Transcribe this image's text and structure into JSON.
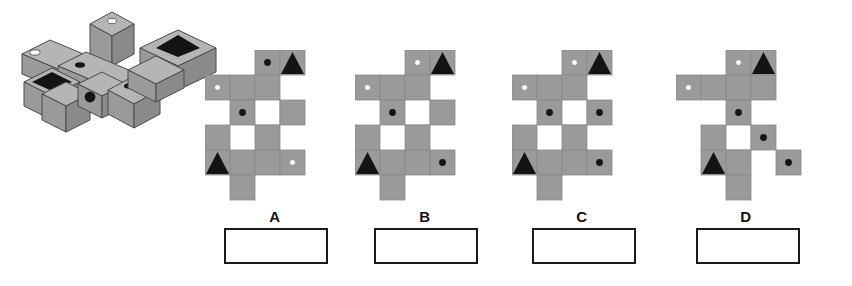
{
  "page": {
    "background_color": "#ffffff"
  },
  "palette": {
    "face_gray": "#9a9a9a",
    "face_gray_light": "#b5b5b5",
    "face_gray_dark": "#8a8a8a",
    "marking_black": "#141414",
    "marking_white": "#ffffff",
    "outline": "#4a4a4a",
    "box_border": "#1a1a1a",
    "label_text": "#111111"
  },
  "stimulus": {
    "name": "isometric-cube-assembly",
    "description": "Three-dimensional assembly of cubes drawn in isometric projection with marked faces",
    "markings": [
      {
        "type": "white-dot",
        "location": "top face of tall raised cube at back"
      },
      {
        "type": "white-dot",
        "location": "top face of left-front long block"
      },
      {
        "type": "black-dot",
        "location": "top face of center-left cube"
      },
      {
        "type": "black-dot",
        "location": "front face of center cube"
      },
      {
        "type": "black-dot",
        "location": "top face of right-front cube"
      },
      {
        "type": "black-triangle",
        "location": "top face of right-rear block"
      },
      {
        "type": "black-triangle",
        "location": "top face of left cube"
      }
    ]
  },
  "grid": {
    "cell_size": 25,
    "columns": 5,
    "rows": 6
  },
  "options": [
    {
      "id": "A",
      "label": "A",
      "name": "option-a",
      "left": 205,
      "cells": [
        {
          "col": 2,
          "row": 0,
          "fill": "gray",
          "mark": "black-dot"
        },
        {
          "col": 3,
          "row": 0,
          "fill": "gray",
          "mark": "black-triangle"
        },
        {
          "col": 0,
          "row": 1,
          "fill": "gray",
          "mark": "white-dot"
        },
        {
          "col": 1,
          "row": 1,
          "fill": "gray",
          "mark": "none"
        },
        {
          "col": 2,
          "row": 1,
          "fill": "gray",
          "mark": "none"
        },
        {
          "col": 1,
          "row": 2,
          "fill": "gray",
          "mark": "black-dot"
        },
        {
          "col": 2,
          "row": 2,
          "fill": "white",
          "mark": "none"
        },
        {
          "col": 3,
          "row": 2,
          "fill": "gray",
          "mark": "none"
        },
        {
          "col": 0,
          "row": 3,
          "fill": "gray",
          "mark": "none"
        },
        {
          "col": 2,
          "row": 3,
          "fill": "gray",
          "mark": "none"
        },
        {
          "col": 0,
          "row": 4,
          "fill": "gray",
          "mark": "black-triangle"
        },
        {
          "col": 1,
          "row": 4,
          "fill": "gray",
          "mark": "none"
        },
        {
          "col": 2,
          "row": 4,
          "fill": "gray",
          "mark": "none"
        },
        {
          "col": 3,
          "row": 4,
          "fill": "gray",
          "mark": "white-dot"
        },
        {
          "col": 1,
          "row": 5,
          "fill": "gray",
          "mark": "none"
        }
      ]
    },
    {
      "id": "B",
      "label": "B",
      "name": "option-b",
      "left": 355,
      "cells": [
        {
          "col": 2,
          "row": 0,
          "fill": "gray",
          "mark": "white-dot"
        },
        {
          "col": 3,
          "row": 0,
          "fill": "gray",
          "mark": "black-triangle"
        },
        {
          "col": 0,
          "row": 1,
          "fill": "gray",
          "mark": "white-dot"
        },
        {
          "col": 1,
          "row": 1,
          "fill": "gray",
          "mark": "none"
        },
        {
          "col": 2,
          "row": 1,
          "fill": "gray",
          "mark": "none"
        },
        {
          "col": 1,
          "row": 2,
          "fill": "gray",
          "mark": "black-dot"
        },
        {
          "col": 2,
          "row": 2,
          "fill": "white",
          "mark": "none"
        },
        {
          "col": 3,
          "row": 2,
          "fill": "gray",
          "mark": "none"
        },
        {
          "col": 0,
          "row": 3,
          "fill": "gray",
          "mark": "none"
        },
        {
          "col": 2,
          "row": 3,
          "fill": "gray",
          "mark": "none"
        },
        {
          "col": 0,
          "row": 4,
          "fill": "gray",
          "mark": "black-triangle"
        },
        {
          "col": 1,
          "row": 4,
          "fill": "gray",
          "mark": "none"
        },
        {
          "col": 2,
          "row": 4,
          "fill": "gray",
          "mark": "none"
        },
        {
          "col": 3,
          "row": 4,
          "fill": "gray",
          "mark": "black-dot"
        },
        {
          "col": 1,
          "row": 5,
          "fill": "gray",
          "mark": "none"
        }
      ]
    },
    {
      "id": "C",
      "label": "C",
      "name": "option-c",
      "left": 512,
      "cells": [
        {
          "col": 2,
          "row": 0,
          "fill": "gray",
          "mark": "white-dot"
        },
        {
          "col": 3,
          "row": 0,
          "fill": "gray",
          "mark": "black-triangle"
        },
        {
          "col": 0,
          "row": 1,
          "fill": "gray",
          "mark": "white-dot"
        },
        {
          "col": 1,
          "row": 1,
          "fill": "gray",
          "mark": "none"
        },
        {
          "col": 2,
          "row": 1,
          "fill": "gray",
          "mark": "none"
        },
        {
          "col": 1,
          "row": 2,
          "fill": "gray",
          "mark": "black-dot"
        },
        {
          "col": 2,
          "row": 2,
          "fill": "white",
          "mark": "none"
        },
        {
          "col": 3,
          "row": 2,
          "fill": "gray",
          "mark": "black-dot"
        },
        {
          "col": 0,
          "row": 3,
          "fill": "gray",
          "mark": "none"
        },
        {
          "col": 2,
          "row": 3,
          "fill": "gray",
          "mark": "none"
        },
        {
          "col": 0,
          "row": 4,
          "fill": "gray",
          "mark": "black-triangle"
        },
        {
          "col": 1,
          "row": 4,
          "fill": "gray",
          "mark": "none"
        },
        {
          "col": 2,
          "row": 4,
          "fill": "gray",
          "mark": "none"
        },
        {
          "col": 3,
          "row": 4,
          "fill": "gray",
          "mark": "black-dot"
        },
        {
          "col": 1,
          "row": 5,
          "fill": "gray",
          "mark": "none"
        }
      ]
    },
    {
      "id": "D",
      "label": "D",
      "name": "option-d",
      "left": 676,
      "cells": [
        {
          "col": 2,
          "row": 0,
          "fill": "gray",
          "mark": "white-dot"
        },
        {
          "col": 3,
          "row": 0,
          "fill": "gray",
          "mark": "black-triangle"
        },
        {
          "col": 0,
          "row": 1,
          "fill": "gray",
          "mark": "white-dot"
        },
        {
          "col": 1,
          "row": 1,
          "fill": "gray",
          "mark": "none"
        },
        {
          "col": 2,
          "row": 1,
          "fill": "gray",
          "mark": "none"
        },
        {
          "col": 3,
          "row": 1,
          "fill": "gray",
          "mark": "none"
        },
        {
          "col": 2,
          "row": 2,
          "fill": "gray",
          "mark": "black-dot"
        },
        {
          "col": 1,
          "row": 3,
          "fill": "gray",
          "mark": "none"
        },
        {
          "col": 2,
          "row": 3,
          "fill": "white",
          "mark": "none"
        },
        {
          "col": 3,
          "row": 3,
          "fill": "gray",
          "mark": "black-dot"
        },
        {
          "col": 1,
          "row": 4,
          "fill": "gray",
          "mark": "black-triangle"
        },
        {
          "col": 2,
          "row": 4,
          "fill": "gray",
          "mark": "none"
        },
        {
          "col": 4,
          "row": 4,
          "fill": "gray",
          "mark": "black-dot"
        },
        {
          "col": 2,
          "row": 5,
          "fill": "gray",
          "mark": "none"
        }
      ]
    }
  ],
  "answer_boxes": [
    {
      "for": "A",
      "name": "answer-box-a",
      "left": 224,
      "value": ""
    },
    {
      "for": "B",
      "name": "answer-box-b",
      "left": 374,
      "value": ""
    },
    {
      "for": "C",
      "name": "answer-box-c",
      "left": 532,
      "value": ""
    },
    {
      "for": "D",
      "name": "answer-box-d",
      "left": 696,
      "value": ""
    }
  ]
}
